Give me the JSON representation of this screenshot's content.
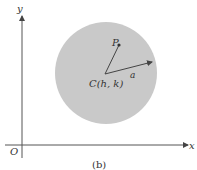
{
  "figure": {
    "caption": "(b)",
    "axes": {
      "x_label": "x",
      "y_label": "y",
      "origin_label": "O"
    },
    "circle": {
      "fill": "#c8c8c8",
      "center_label": "C(h, k)"
    },
    "point_label": "P",
    "radius_label": "a"
  }
}
